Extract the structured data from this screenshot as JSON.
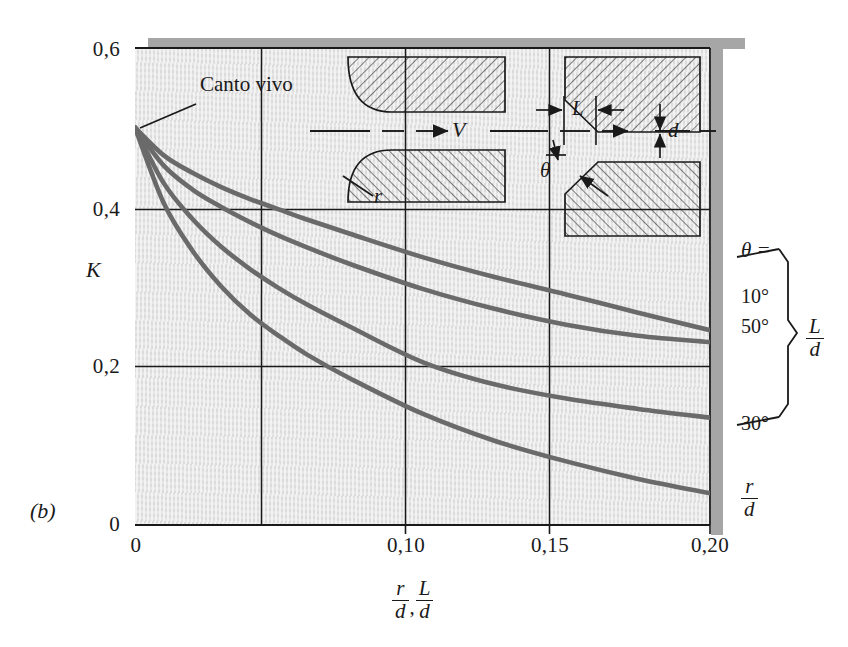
{
  "figure": {
    "panel_label": "(b)",
    "y_axis_label": "K",
    "x_axis_label_parts": [
      "r/d",
      "L/d"
    ],
    "annotation_sharp_edge": "Canto vivo",
    "theta_header": "θ =",
    "curve_labels": [
      "10°",
      "50°",
      "30°"
    ],
    "brace_label": "L/d",
    "bottom_right_label": "r/d",
    "inset_left": {
      "velocity_label": "V",
      "radius_label": "r"
    },
    "inset_right": {
      "length_label": "L",
      "diameter_label": "d",
      "angle_label": "θ"
    }
  },
  "colors": {
    "curve": "#6a6a6a",
    "axis": "#1a1a1a",
    "plot_background": "#e8e8e8",
    "shadow": "#a6a6a6",
    "text": "#1a1a1a"
  },
  "axes": {
    "y_ticks": [
      "0",
      "0,2",
      "0,4",
      "0,6"
    ],
    "y_tick_values": [
      0,
      0.2,
      0.4,
      0.6
    ],
    "x_ticks": [
      "0",
      "0,10",
      "0,15",
      "0,20"
    ],
    "x_tick_values": [
      0,
      0.1,
      0.15,
      0.2
    ],
    "x_gridlines": [
      0.05,
      0.1,
      0.15
    ],
    "y_gridlines": [
      0.2,
      0.4
    ],
    "xlim": [
      0,
      0.2
    ],
    "ylim": [
      0,
      0.6
    ]
  },
  "chart_data": {
    "type": "line",
    "title": "",
    "xlabel": "r/d , L/d",
    "ylabel": "K",
    "xlim": [
      0,
      0.2
    ],
    "ylim": [
      0,
      0.6
    ],
    "grid": true,
    "legend": "right-side labels",
    "annotations": [
      {
        "text": "Canto vivo",
        "x": 0.0,
        "y": 0.5,
        "note": "sharp-edged entrance; all curves originate here"
      }
    ],
    "series": [
      {
        "name": "10°",
        "label_position": "right",
        "quantity": "L/d",
        "x": [
          0.0,
          0.01,
          0.02,
          0.03,
          0.04,
          0.05,
          0.06,
          0.075,
          0.1,
          0.125,
          0.15,
          0.175,
          0.2
        ],
        "values": [
          0.5,
          0.465,
          0.443,
          0.425,
          0.41,
          0.397,
          0.384,
          0.366,
          0.337,
          0.312,
          0.29,
          0.267,
          0.245
        ]
      },
      {
        "name": "50°",
        "label_position": "right",
        "quantity": "L/d",
        "x": [
          0.0,
          0.01,
          0.02,
          0.03,
          0.04,
          0.05,
          0.06,
          0.075,
          0.1,
          0.125,
          0.15,
          0.175,
          0.2
        ],
        "values": [
          0.5,
          0.452,
          0.422,
          0.4,
          0.381,
          0.364,
          0.349,
          0.328,
          0.297,
          0.272,
          0.252,
          0.238,
          0.23
        ]
      },
      {
        "name": "30°",
        "label_position": "right",
        "quantity": "L/d",
        "x": [
          0.0,
          0.01,
          0.02,
          0.03,
          0.04,
          0.05,
          0.06,
          0.075,
          0.1,
          0.125,
          0.15,
          0.175,
          0.2
        ],
        "values": [
          0.5,
          0.43,
          0.385,
          0.35,
          0.322,
          0.298,
          0.277,
          0.249,
          0.205,
          0.177,
          0.159,
          0.146,
          0.135
        ]
      },
      {
        "name": "r/d",
        "label_position": "right",
        "quantity": "r/d",
        "x": [
          0.0,
          0.01,
          0.02,
          0.03,
          0.04,
          0.05,
          0.06,
          0.075,
          0.1,
          0.125,
          0.15,
          0.175,
          0.2
        ],
        "values": [
          0.5,
          0.405,
          0.345,
          0.3,
          0.265,
          0.238,
          0.214,
          0.184,
          0.14,
          0.106,
          0.08,
          0.058,
          0.04
        ]
      }
    ]
  }
}
